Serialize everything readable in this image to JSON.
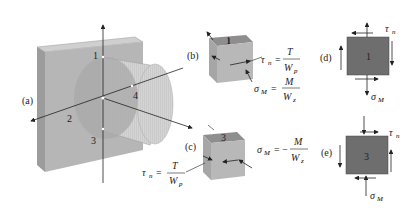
{
  "figure": {
    "panel_labels": {
      "a": "(a)",
      "b": "(b)",
      "c": "(c)",
      "d": "(d)",
      "e": "(e)"
    },
    "points": [
      "1",
      "2",
      "3",
      "4"
    ],
    "equations": {
      "b_tau": {
        "lhs": "τ",
        "sub": "n",
        "eq": "=",
        "num": "T",
        "den": "W",
        "den_sub": "p"
      },
      "b_sigma": {
        "lhs": "σ",
        "sub": "M",
        "eq": "=",
        "num": "M",
        "den": "W",
        "den_sub": "z"
      },
      "c_tau": {
        "lhs": "τ",
        "sub": "n",
        "eq": "=",
        "num": "T",
        "den": "W",
        "den_sub": "p"
      },
      "c_sigma": {
        "lhs": "σ",
        "sub": "M",
        "eq": "= −",
        "num": "M",
        "den": "W",
        "den_sub": "z"
      },
      "d_tau": {
        "lhs": "τ",
        "sub": "n"
      },
      "d_sigma": {
        "lhs": "σ",
        "sub": "M"
      },
      "e_tau": {
        "lhs": "τ",
        "sub": "n"
      },
      "e_sigma": {
        "lhs": "σ",
        "sub": "M"
      }
    },
    "colors": {
      "wall_front": "#b4b4b4",
      "wall_top": "#c8c8c8",
      "wall_side": "#9a9a9a",
      "cylinder": "#c4c4c4",
      "element_front": "#b8b8b8",
      "element_top": "#8e8e8e",
      "square_fill": "#6e6e6e",
      "line": "#222222"
    }
  }
}
